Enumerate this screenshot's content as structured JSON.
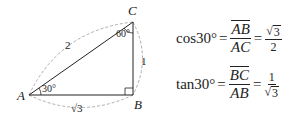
{
  "diagram": {
    "vertices": {
      "A": {
        "label": "A",
        "x": 29,
        "y": 95
      },
      "B": {
        "label": "B",
        "x": 133,
        "y": 95
      },
      "C": {
        "label": "C",
        "x": 133,
        "y": 22
      }
    },
    "angle_A": "30°",
    "angle_C": "60°",
    "right_angle_at": "B",
    "side_AC": "2",
    "side_BC": "1",
    "side_AB": "√3",
    "colors": {
      "stroke": "#222222",
      "dashed": "#999999"
    }
  },
  "formulas": {
    "cos": {
      "fn": "cos30°",
      "eq1": "=",
      "num": "AB",
      "den": "AC",
      "eq2": "=",
      "res_num": "3",
      "res_den": "2",
      "sqrt_sign": "√"
    },
    "tan": {
      "fn": "tan30°",
      "eq1": "=",
      "num": "BC",
      "den": "AB",
      "eq2": "=",
      "res_num": "1",
      "res_den": "3",
      "sqrt_sign": "√"
    }
  }
}
